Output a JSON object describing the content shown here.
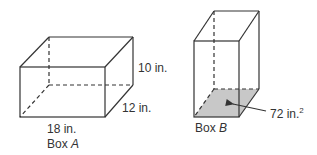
{
  "diagram": {
    "box_a": {
      "name": "Box A",
      "name_prefix": "Box ",
      "name_letter": "A",
      "length": "18 in.",
      "width": "12 in.",
      "height": "10 in."
    },
    "box_b": {
      "name": "Box B",
      "name_prefix": "Box ",
      "name_letter": "B",
      "base_area": "72 in.",
      "base_area_exp": "2",
      "base_fill": "#c8c8c8"
    },
    "colors": {
      "stroke": "#333333",
      "text": "#333333"
    }
  }
}
